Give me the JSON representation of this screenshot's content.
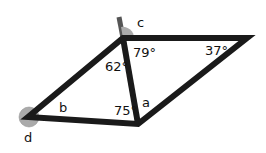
{
  "diagram": {
    "type": "geometry-angles",
    "shape": "parallelogram split by a diagonal into two triangles",
    "colors": {
      "line": "#1a1a1a",
      "angle_marker": "#aaaaaa",
      "extension": "#555555",
      "background": "#ffffff"
    },
    "vertices": {
      "left": [
        28,
        117
      ],
      "top": [
        123,
        38
      ],
      "right": [
        247,
        38
      ],
      "bottom": [
        138,
        124
      ]
    },
    "labels": {
      "angle_top_right_triangle": "79°",
      "angle_right": "37°",
      "angle_top_left_triangle": "62°",
      "angle_bottom_left_triangle": "75°",
      "unknown_a": "a",
      "unknown_b": "b",
      "unknown_c": "c",
      "unknown_d": "d"
    }
  }
}
